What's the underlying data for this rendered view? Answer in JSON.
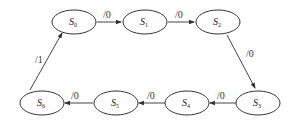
{
  "diagram": {
    "type": "state-transition",
    "states": [
      {
        "id": "S0",
        "name": "S",
        "sub": "0",
        "cx": 74,
        "cy": 22
      },
      {
        "id": "S1",
        "name": "S",
        "sub": "1",
        "cx": 145,
        "cy": 22
      },
      {
        "id": "S2",
        "name": "S",
        "sub": "2",
        "cx": 218,
        "cy": 22
      },
      {
        "id": "S3",
        "name": "S",
        "sub": "3",
        "cx": 258,
        "cy": 102
      },
      {
        "id": "S4",
        "name": "S",
        "sub": "4",
        "cx": 187,
        "cy": 102
      },
      {
        "id": "S5",
        "name": "S",
        "sub": "5",
        "cx": 116,
        "cy": 102
      },
      {
        "id": "S6",
        "name": "S",
        "sub": "6",
        "cx": 42,
        "cy": 102
      }
    ],
    "transitions": [
      {
        "from": "S0",
        "to": "S1",
        "label": "/0"
      },
      {
        "from": "S1",
        "to": "S2",
        "label": "/0"
      },
      {
        "from": "S2",
        "to": "S3",
        "label": "/0"
      },
      {
        "from": "S3",
        "to": "S4",
        "label": "/0"
      },
      {
        "from": "S4",
        "to": "S5",
        "label": "/0"
      },
      {
        "from": "S5",
        "to": "S6",
        "label": "/0"
      },
      {
        "from": "S6",
        "to": "S0",
        "label": "/1"
      }
    ]
  }
}
